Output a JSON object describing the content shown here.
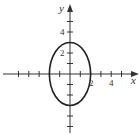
{
  "diagram": {
    "type": "ellipse-graph",
    "equation_implied": "x^2/4 + y^2/9 = 1",
    "center": [
      0,
      0
    ],
    "semi_axis_x": 2,
    "semi_axis_y": 3,
    "axes": {
      "x_label": "x",
      "y_label": "y",
      "x_tick_labels": [
        {
          "value": 2,
          "text": "2"
        },
        {
          "value": 4,
          "text": "4"
        }
      ],
      "y_tick_labels": [
        {
          "value": 2,
          "text": "2"
        },
        {
          "value": 4,
          "text": "4"
        }
      ],
      "x_ticks": [
        -5,
        -4,
        -3,
        -2,
        -1,
        1,
        2,
        3,
        4,
        5
      ],
      "y_ticks": [
        -5,
        -4,
        -3,
        -2,
        -1,
        1,
        2,
        3,
        4,
        5
      ],
      "x_range": [
        -6.5,
        6.6
      ],
      "y_range": [
        -5.6,
        6.7
      ]
    },
    "colors": {
      "axis": "#333333",
      "curve": "#222222",
      "background": "#ffffff"
    }
  }
}
